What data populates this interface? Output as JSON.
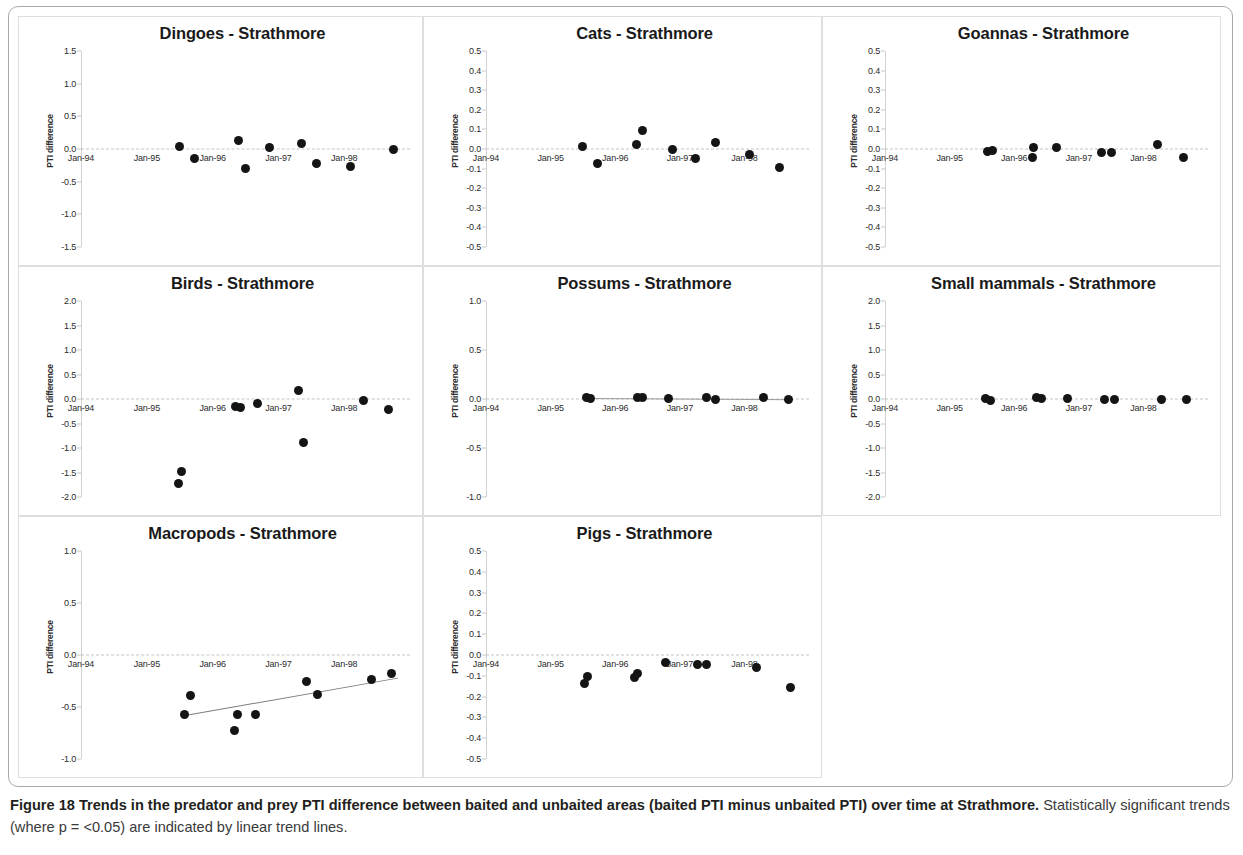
{
  "figure": {
    "caption_bold": "Figure 18 Trends in the predator and prey PTI difference between baited and unbaited areas (baited PTI minus unbaited PTI) over time at Strathmore.",
    "caption_rest": " Statistically significant trends (where p = <0.05) are indicated by linear trend lines.",
    "y_axis_label": "PTI difference",
    "x_tick_labels": [
      "Jan-94",
      "Jan-95",
      "Jan-96",
      "Jan-97",
      "Jan-98"
    ],
    "dot_color": "#141414",
    "trend_color": "#7d7d7d",
    "zero_line_color": "#c4c4c4"
  },
  "chart_data": [
    {
      "type": "scatter",
      "title": "Dingoes - Strathmore",
      "xlabel": "",
      "ylabel": "PTI difference",
      "ylim": [
        -1.5,
        1.5
      ],
      "yticks": [
        1.5,
        1.0,
        0.5,
        0.0,
        -0.5,
        -1.0,
        -1.5
      ],
      "xlim": [
        1994.0,
        1999.0
      ],
      "xticks": [
        1994,
        1995,
        1996,
        1997,
        1998
      ],
      "xticklabels": [
        "Jan-94",
        "Jan-95",
        "Jan-96",
        "Jan-97",
        "Jan-98"
      ],
      "grid": false,
      "trend_line": null,
      "points": [
        {
          "x": 1995.5,
          "y": 0.04
        },
        {
          "x": 1995.72,
          "y": -0.15
        },
        {
          "x": 1996.4,
          "y": 0.13
        },
        {
          "x": 1996.5,
          "y": -0.3
        },
        {
          "x": 1996.86,
          "y": 0.03
        },
        {
          "x": 1997.35,
          "y": 0.08
        },
        {
          "x": 1997.58,
          "y": -0.22
        },
        {
          "x": 1998.1,
          "y": -0.27
        },
        {
          "x": 1998.75,
          "y": -0.01
        }
      ]
    },
    {
      "type": "scatter",
      "title": "Cats - Strathmore",
      "xlabel": "",
      "ylabel": "PTI difference",
      "ylim": [
        -0.5,
        0.5
      ],
      "yticks": [
        0.5,
        0.4,
        0.3,
        0.2,
        0.1,
        0.0,
        -0.1,
        -0.2,
        -0.3,
        -0.4,
        -0.5
      ],
      "xlim": [
        1994.0,
        1999.0
      ],
      "xticks": [
        1994,
        1995,
        1996,
        1997,
        1998
      ],
      "xticklabels": [
        "Jan-94",
        "Jan-95",
        "Jan-96",
        "Jan-97",
        "Jan-98"
      ],
      "grid": false,
      "trend_line": null,
      "points": [
        {
          "x": 1995.5,
          "y": 0.012
        },
        {
          "x": 1995.72,
          "y": -0.075
        },
        {
          "x": 1996.33,
          "y": 0.022
        },
        {
          "x": 1996.42,
          "y": 0.095
        },
        {
          "x": 1996.88,
          "y": -0.005
        },
        {
          "x": 1997.25,
          "y": -0.05
        },
        {
          "x": 1997.55,
          "y": 0.032
        },
        {
          "x": 1998.08,
          "y": -0.03
        },
        {
          "x": 1998.55,
          "y": -0.095
        }
      ]
    },
    {
      "type": "scatter",
      "title": "Goannas - Strathmore",
      "xlabel": "",
      "ylabel": "PTI difference",
      "ylim": [
        -0.5,
        0.5
      ],
      "yticks": [
        0.5,
        0.4,
        0.3,
        0.2,
        0.1,
        0.0,
        -0.1,
        -0.2,
        -0.3,
        -0.4,
        -0.5
      ],
      "xlim": [
        1994.0,
        1999.0
      ],
      "xticks": [
        1994,
        1995,
        1996,
        1997,
        1998
      ],
      "xticklabels": [
        "Jan-94",
        "Jan-95",
        "Jan-96",
        "Jan-97",
        "Jan-98"
      ],
      "grid": false,
      "trend_line": null,
      "points": [
        {
          "x": 1995.58,
          "y": -0.012
        },
        {
          "x": 1995.66,
          "y": -0.008
        },
        {
          "x": 1996.3,
          "y": 0.006
        },
        {
          "x": 1996.28,
          "y": -0.045
        },
        {
          "x": 1996.65,
          "y": 0.006
        },
        {
          "x": 1997.35,
          "y": -0.018
        },
        {
          "x": 1997.5,
          "y": -0.016
        },
        {
          "x": 1998.22,
          "y": 0.024
        },
        {
          "x": 1998.62,
          "y": -0.042
        }
      ]
    },
    {
      "type": "scatter",
      "title": "Birds - Strathmore",
      "xlabel": "",
      "ylabel": "PTI difference",
      "ylim": [
        -2.0,
        2.0
      ],
      "yticks": [
        2.0,
        1.5,
        1.0,
        0.5,
        0.0,
        -0.5,
        -1.0,
        -1.5,
        -2.0
      ],
      "xlim": [
        1994.0,
        1999.0
      ],
      "xticks": [
        1994,
        1995,
        1996,
        1997,
        1998
      ],
      "xticklabels": [
        "Jan-94",
        "Jan-95",
        "Jan-96",
        "Jan-97",
        "Jan-98"
      ],
      "grid": false,
      "trend_line": null,
      "points": [
        {
          "x": 1995.52,
          "y": -1.47
        },
        {
          "x": 1995.48,
          "y": -1.72
        },
        {
          "x": 1996.35,
          "y": -0.16
        },
        {
          "x": 1996.42,
          "y": -0.18
        },
        {
          "x": 1996.68,
          "y": -0.1
        },
        {
          "x": 1997.3,
          "y": 0.18
        },
        {
          "x": 1997.38,
          "y": -0.88
        },
        {
          "x": 1998.3,
          "y": -0.04
        },
        {
          "x": 1998.68,
          "y": -0.22
        }
      ]
    },
    {
      "type": "scatter",
      "title": "Possums - Strathmore",
      "xlabel": "",
      "ylabel": "PTI difference",
      "ylim": [
        -1.0,
        1.0
      ],
      "yticks": [
        1.0,
        0.5,
        0.0,
        -0.5,
        -1.0
      ],
      "xlim": [
        1994.0,
        1999.0
      ],
      "xticks": [
        1994,
        1995,
        1996,
        1997,
        1998
      ],
      "xticklabels": [
        "Jan-94",
        "Jan-95",
        "Jan-96",
        "Jan-97",
        "Jan-98"
      ],
      "grid": false,
      "trend_line": {
        "x0": 1995.55,
        "y0": 0.012,
        "x1": 1998.72,
        "y1": 0.0
      },
      "points": [
        {
          "x": 1995.55,
          "y": 0.015
        },
        {
          "x": 1995.62,
          "y": 0.008
        },
        {
          "x": 1996.35,
          "y": 0.015
        },
        {
          "x": 1996.43,
          "y": 0.012
        },
        {
          "x": 1996.82,
          "y": 0.01
        },
        {
          "x": 1997.42,
          "y": 0.012
        },
        {
          "x": 1997.56,
          "y": -0.005
        },
        {
          "x": 1998.3,
          "y": 0.012
        },
        {
          "x": 1998.68,
          "y": 0.0
        }
      ]
    },
    {
      "type": "scatter",
      "title": "Small mammals - Strathmore",
      "xlabel": "",
      "ylabel": "PTI difference",
      "ylim": [
        -2.0,
        2.0
      ],
      "yticks": [
        2.0,
        1.5,
        1.0,
        0.5,
        0.0,
        -0.5,
        -1.0,
        -1.5,
        -2.0
      ],
      "xlim": [
        1994.0,
        1999.0
      ],
      "xticks": [
        1994,
        1995,
        1996,
        1997,
        1998
      ],
      "xticklabels": [
        "Jan-94",
        "Jan-95",
        "Jan-96",
        "Jan-97",
        "Jan-98"
      ],
      "grid": false,
      "trend_line": null,
      "points": [
        {
          "x": 1995.55,
          "y": 0.015
        },
        {
          "x": 1995.63,
          "y": -0.03
        },
        {
          "x": 1996.35,
          "y": 0.025
        },
        {
          "x": 1996.43,
          "y": 0.02
        },
        {
          "x": 1996.82,
          "y": 0.02
        },
        {
          "x": 1997.4,
          "y": 0.0
        },
        {
          "x": 1997.55,
          "y": 0.0
        },
        {
          "x": 1998.28,
          "y": 0.0
        },
        {
          "x": 1998.66,
          "y": 0.0
        }
      ]
    },
    {
      "type": "scatter",
      "title": "Macropods - Strathmore",
      "xlabel": "",
      "ylabel": "PTI difference",
      "ylim": [
        -1.0,
        1.0
      ],
      "yticks": [
        1.0,
        0.5,
        0.0,
        -0.5,
        -1.0
      ],
      "xlim": [
        1994.0,
        1999.0
      ],
      "xticks": [
        1994,
        1995,
        1996,
        1997,
        1998
      ],
      "xticklabels": [
        "Jan-94",
        "Jan-95",
        "Jan-96",
        "Jan-97",
        "Jan-98"
      ],
      "grid": false,
      "trend_line": {
        "x0": 1995.58,
        "y0": -0.58,
        "x1": 1998.82,
        "y1": -0.22
      },
      "points": [
        {
          "x": 1995.66,
          "y": -0.39
        },
        {
          "x": 1995.58,
          "y": -0.57
        },
        {
          "x": 1996.38,
          "y": -0.57
        },
        {
          "x": 1996.33,
          "y": -0.73
        },
        {
          "x": 1996.65,
          "y": -0.57
        },
        {
          "x": 1997.42,
          "y": -0.25
        },
        {
          "x": 1997.6,
          "y": -0.38
        },
        {
          "x": 1998.42,
          "y": -0.24
        },
        {
          "x": 1998.72,
          "y": -0.18
        }
      ]
    },
    {
      "type": "scatter",
      "title": "Pigs - Strathmore",
      "xlabel": "",
      "ylabel": "PTI difference",
      "ylim": [
        -0.5,
        0.5
      ],
      "yticks": [
        0.5,
        0.4,
        0.3,
        0.2,
        0.1,
        0.0,
        -0.1,
        -0.2,
        -0.3,
        -0.4,
        -0.5
      ],
      "xlim": [
        1994.0,
        1999.0
      ],
      "xticks": [
        1994,
        1995,
        1996,
        1997,
        1998
      ],
      "xticklabels": [
        "Jan-94",
        "Jan-95",
        "Jan-96",
        "Jan-97",
        "Jan-98"
      ],
      "grid": false,
      "trend_line": null,
      "points": [
        {
          "x": 1995.57,
          "y": -0.105
        },
        {
          "x": 1995.52,
          "y": -0.135
        },
        {
          "x": 1996.35,
          "y": -0.09
        },
        {
          "x": 1996.3,
          "y": -0.11
        },
        {
          "x": 1996.78,
          "y": -0.035
        },
        {
          "x": 1997.28,
          "y": -0.045
        },
        {
          "x": 1997.42,
          "y": -0.045
        },
        {
          "x": 1998.18,
          "y": -0.06
        },
        {
          "x": 1998.72,
          "y": -0.155
        }
      ]
    }
  ]
}
